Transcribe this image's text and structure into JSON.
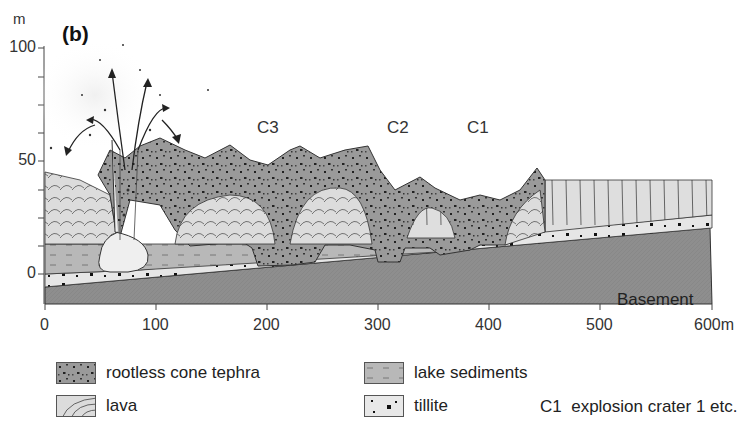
{
  "figure": {
    "panel_label": "(b)",
    "y_axis": {
      "unit": "m",
      "ticks": [
        "100",
        "50",
        "0"
      ]
    },
    "x_axis": {
      "ticks": [
        "0",
        "100",
        "200",
        "300",
        "400",
        "500",
        "600m"
      ]
    },
    "crater_labels": [
      "C3",
      "C2",
      "C1"
    ],
    "basement_label": "Basement"
  },
  "legend": {
    "items": [
      {
        "key": "tephra",
        "label": "rootless cone tephra"
      },
      {
        "key": "lava",
        "label": "lava"
      },
      {
        "key": "lake",
        "label": "lake sediments"
      },
      {
        "key": "tillite",
        "label": "tillite"
      }
    ],
    "note": "C1  explosion crater 1 etc."
  },
  "colors": {
    "tephra": "#9a9a9a",
    "lava": "#dcdcdc",
    "lake_sediments": "#b8b8b8",
    "tillite": "#e8e8e8",
    "basement": "#8e8e8e",
    "outline": "#333333"
  }
}
